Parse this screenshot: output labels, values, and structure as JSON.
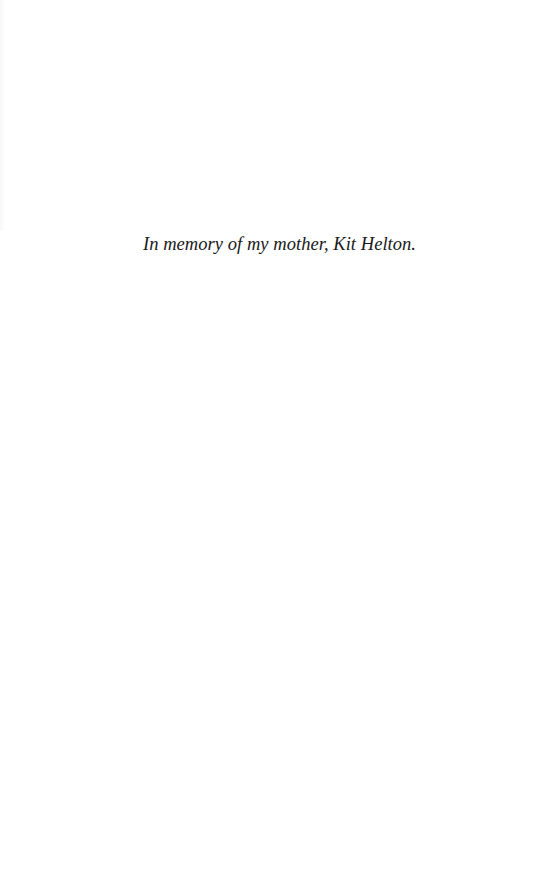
{
  "page": {
    "dedication": "In memory of my mother, Kit Helton."
  }
}
